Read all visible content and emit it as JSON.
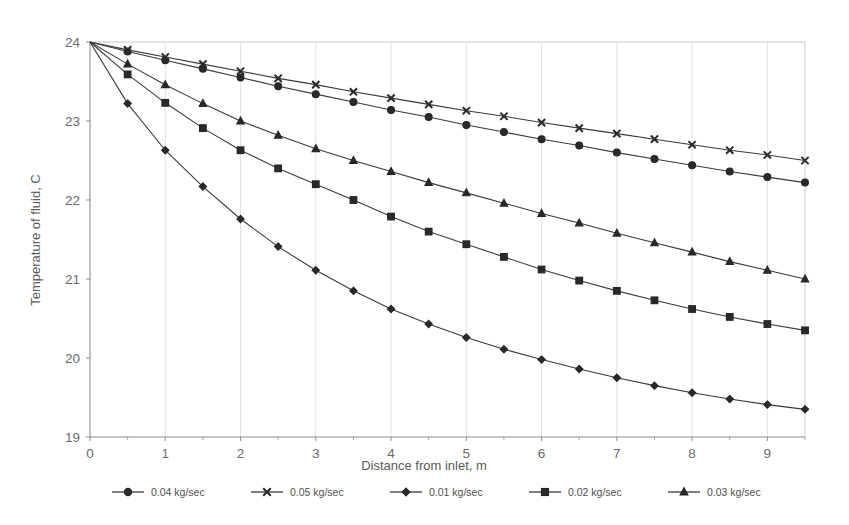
{
  "chart_data": {
    "type": "line",
    "title": "",
    "xlabel": "Distance from inlet, m",
    "ylabel": "Temperature of fluid, C",
    "xlim": [
      0,
      9.5
    ],
    "ylim": [
      19,
      24
    ],
    "xticks": [
      0,
      1,
      2,
      3,
      4,
      5,
      6,
      7,
      8,
      9
    ],
    "xtick_labels": [
      "0",
      "1",
      "2",
      "3",
      "4",
      "5",
      "6",
      "7",
      "8",
      "9"
    ],
    "yticks": [
      19,
      20,
      21,
      22,
      23,
      24
    ],
    "ytick_labels": [
      "19",
      "20",
      "21",
      "22",
      "23",
      "24"
    ],
    "minor_x_step": 0.5,
    "grid": "vertical-only",
    "legend_position": "bottom",
    "x": [
      0,
      0.5,
      1,
      1.5,
      2,
      2.5,
      3,
      3.5,
      4,
      4.5,
      5,
      5.5,
      6,
      6.5,
      7,
      7.5,
      8,
      8.5,
      9,
      9.5
    ],
    "series": [
      {
        "name": "0.04 kg/sec",
        "marker": "circle",
        "values": [
          24.0,
          23.88,
          23.77,
          23.66,
          23.55,
          23.44,
          23.34,
          23.24,
          23.14,
          23.05,
          22.95,
          22.86,
          22.77,
          22.69,
          22.6,
          22.52,
          22.44,
          22.36,
          22.29,
          22.22
        ]
      },
      {
        "name": "0.05 kg/sec",
        "marker": "x",
        "values": [
          24.0,
          23.9,
          23.81,
          23.72,
          23.63,
          23.54,
          23.46,
          23.37,
          23.29,
          23.21,
          23.13,
          23.06,
          22.98,
          22.91,
          22.84,
          22.77,
          22.7,
          22.63,
          22.57,
          22.5
        ]
      },
      {
        "name": "0.01 kg/sec",
        "marker": "diamond",
        "values": [
          24.0,
          23.22,
          22.63,
          22.17,
          21.76,
          21.41,
          21.11,
          20.85,
          20.62,
          20.43,
          20.26,
          20.11,
          19.98,
          19.86,
          19.75,
          19.65,
          19.56,
          19.48,
          19.41,
          19.35
        ]
      },
      {
        "name": "0.02 kg/sec",
        "marker": "square",
        "values": [
          24.0,
          23.59,
          23.23,
          22.91,
          22.63,
          22.4,
          22.2,
          22.0,
          21.79,
          21.6,
          21.44,
          21.28,
          21.12,
          20.98,
          20.85,
          20.73,
          20.62,
          20.52,
          20.43,
          20.35
        ]
      },
      {
        "name": "0.03 kg/sec",
        "marker": "triangle",
        "values": [
          24.0,
          23.72,
          23.46,
          23.22,
          23.0,
          22.82,
          22.65,
          22.5,
          22.36,
          22.22,
          22.09,
          21.96,
          21.83,
          21.71,
          21.58,
          21.46,
          21.34,
          21.22,
          21.11,
          21.0
        ]
      }
    ],
    "legend_entries": [
      {
        "label": "0.04 kg/sec",
        "marker": "circle"
      },
      {
        "label": "0.05 kg/sec",
        "marker": "x"
      },
      {
        "label": "0.01 kg/sec",
        "marker": "diamond"
      },
      {
        "label": "0.02 kg/sec",
        "marker": "square"
      },
      {
        "label": "0.03 kg/sec",
        "marker": "triangle"
      }
    ],
    "colors": {
      "line": "#3a3a3a",
      "marker": "#2a2a2a",
      "grid": "#e2e2e2",
      "axis": "#8d8d8d",
      "text": "#5a5a5a",
      "background": "#ffffff"
    }
  }
}
